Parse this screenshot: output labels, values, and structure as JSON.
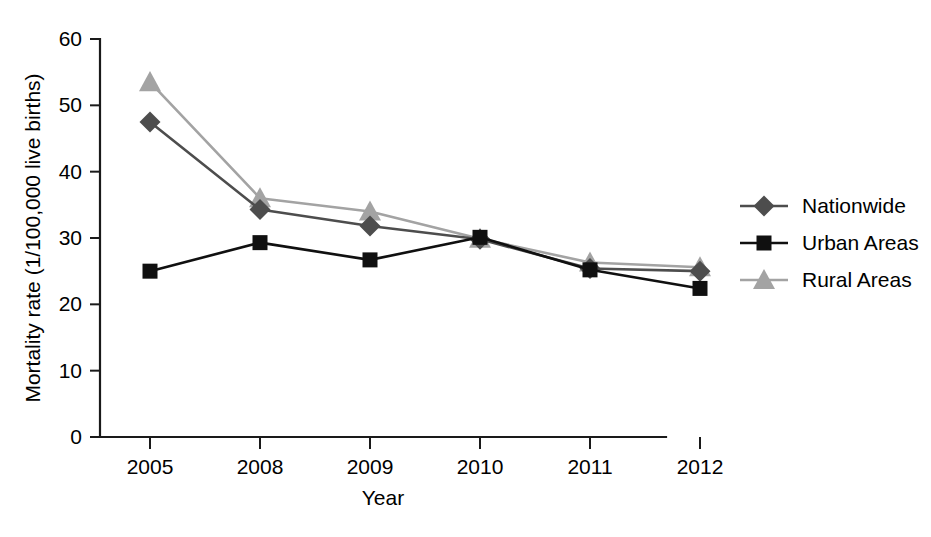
{
  "chart_data": {
    "type": "line",
    "title": "",
    "xlabel": "Year",
    "ylabel": "Mortality rate (1/100,000 live births)",
    "categories": [
      "2005",
      "2008",
      "2009",
      "2010",
      "2011",
      "2012"
    ],
    "ylim": [
      0,
      60
    ],
    "yticks": [
      0,
      10,
      20,
      30,
      40,
      50,
      60
    ],
    "ytick_labels": [
      "0",
      "10",
      "20",
      "30",
      "40",
      "50",
      "60"
    ],
    "grid": false,
    "legend_position": "right",
    "series": [
      {
        "name": "Nationwide",
        "color": "#4d4d4d",
        "marker": "diamond",
        "values": [
          47.5,
          34.3,
          31.8,
          29.8,
          25.4,
          25.0
        ]
      },
      {
        "name": "Urban Areas",
        "color": "#101010",
        "marker": "square",
        "values": [
          25.0,
          29.3,
          26.7,
          30.1,
          25.2,
          22.4
        ]
      },
      {
        "name": "Rural Areas",
        "color": "#a3a3a3",
        "marker": "triangle",
        "values": [
          53.5,
          36.0,
          34.0,
          29.9,
          26.3,
          25.6
        ]
      }
    ]
  },
  "axes": {
    "y_axis_title": "Mortality rate (1/100,000 live births)",
    "x_axis_title": "Year"
  },
  "legend": {
    "entries": [
      {
        "label": "Nationwide"
      },
      {
        "label": "Urban Areas"
      },
      {
        "label": "Rural Areas"
      }
    ]
  }
}
